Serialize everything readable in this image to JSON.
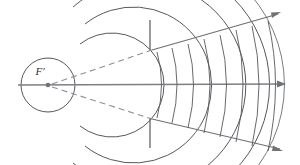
{
  "figure": {
    "focus_label": "F′",
    "background_color": "#ffffff",
    "line_color": "#55585c",
    "ray_color": "#6f7276",
    "dashed_color": "#8d9094"
  },
  "geometry": {
    "focus": {
      "x": 48,
      "y": 85
    },
    "axis": {
      "x1": 18,
      "y1": 85,
      "x2": 286,
      "y2": 84
    },
    "aperture": {
      "x": 150,
      "upper_edge": {
        "y1": 20,
        "y2": 50
      },
      "lower_edge": {
        "y1": 118,
        "y2": 148
      },
      "gap_top": 50,
      "gap_bottom": 118
    },
    "arrow_tips": [
      {
        "name": "upper-ray-arrow",
        "x": 281,
        "y": 12
      },
      {
        "name": "axis-ray-arrow",
        "x": 286,
        "y": 84
      },
      {
        "name": "lower-ray-arrow",
        "x": 283,
        "y": 151
      }
    ],
    "focus_circle_radius": 27
  },
  "source_waves": {
    "description": "Concentric circular wavefronts centered on the focus",
    "radii": [
      27,
      52,
      78,
      104,
      122,
      137
    ],
    "arc_half_angles_deg": [
      180,
      128,
      118,
      104,
      96,
      92
    ]
  },
  "cone_waves": {
    "description": "Curved wavefronts inside the diverging cone",
    "count": 8,
    "axis_crossings_x": [
      162,
      178,
      194,
      211,
      228,
      245,
      261,
      277
    ],
    "curvature": "convex toward the right"
  },
  "dashed_construction_lines": [
    {
      "name": "upper-construction-line",
      "from": [
        48,
        85
      ],
      "to": [
        152,
        50
      ]
    },
    {
      "name": "lower-construction-line",
      "from": [
        48,
        85
      ],
      "to": [
        152,
        119
      ]
    }
  ]
}
